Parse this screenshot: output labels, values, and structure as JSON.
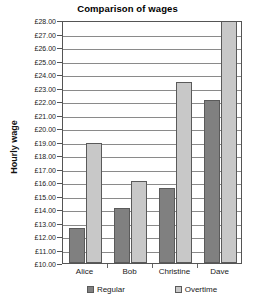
{
  "chart_data": {
    "type": "bar",
    "title": "Comparison of wages",
    "xlabel": "",
    "ylabel": "Hourly wage",
    "categories": [
      "Alice",
      "Bob",
      "Christine",
      "Dave"
    ],
    "series": [
      {
        "name": "Regular",
        "values": [
          12.5,
          14.0,
          15.5,
          22.0
        ],
        "color": "#808080"
      },
      {
        "name": "Overtime",
        "values": [
          18.8,
          16.0,
          23.3,
          28.0
        ],
        "color": "#c8c8c8"
      }
    ],
    "ylim": [
      10.0,
      28.0
    ],
    "ytick_step": 1.0,
    "ytick_labels": [
      "£28.00",
      "£27.00",
      "£26.00",
      "£25.00",
      "£24.00",
      "£23.00",
      "£22.00",
      "£21.00",
      "£20.00",
      "£19.00",
      "£18.00",
      "£17.00",
      "£16.00",
      "£15.00",
      "£14.00",
      "£13.00",
      "£12.00",
      "£11.00",
      "£10.00"
    ],
    "ytick_values": [
      28,
      27,
      26,
      25,
      24,
      23,
      22,
      21,
      20,
      19,
      18,
      17,
      16,
      15,
      14,
      13,
      12,
      11,
      10
    ],
    "grid": "horizontal",
    "legend_position": "bottom",
    "legend": [
      "Regular",
      "Overtime"
    ]
  }
}
